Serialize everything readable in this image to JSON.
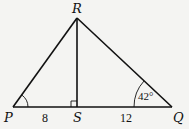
{
  "diagram": {
    "vertices": {
      "P": {
        "label": "P"
      },
      "Q": {
        "label": "Q"
      },
      "R": {
        "label": "R"
      },
      "S": {
        "label": "S"
      }
    },
    "segments": {
      "PS": {
        "length_label": "8"
      },
      "SQ": {
        "length_label": "12"
      }
    },
    "angles": {
      "Q": {
        "label": "42°"
      },
      "RSP": {
        "marker": "right-angle"
      }
    },
    "colors": {
      "stroke": "#111111",
      "background": "#f4f4f2"
    }
  }
}
